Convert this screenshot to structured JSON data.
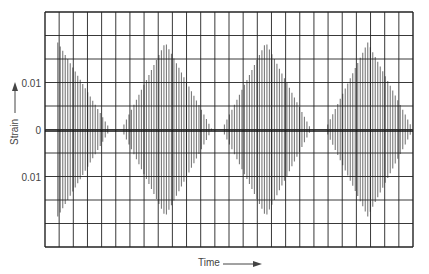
{
  "chart_data": {
    "type": "line",
    "title": "",
    "xlabel": "Time",
    "ylabel": "Strain",
    "y_tick_labels": [
      {
        "label": "0.01",
        "value": 0.01
      },
      {
        "label": "0",
        "value": 0
      },
      {
        "label": "0.01",
        "value": -0.01
      }
    ],
    "ylim": [
      -0.027,
      0.027
    ],
    "grid": true,
    "grid_divisions": {
      "x": 26,
      "y": 10
    },
    "series": [
      {
        "name": "strain envelope",
        "bursts": [
          {
            "start_x_div": 0.9,
            "peak_x_div": 0.9,
            "end_x_div": 4.6,
            "peak_amplitude": 0.02
          },
          {
            "start_x_div": 5.4,
            "peak_x_div": 8.5,
            "end_x_div": 11.8,
            "peak_amplitude": 0.02
          },
          {
            "start_x_div": 12.5,
            "peak_x_div": 15.6,
            "end_x_div": 18.8,
            "peak_amplitude": 0.02
          },
          {
            "start_x_div": 19.8,
            "peak_x_div": 22.8,
            "end_x_div": 26.0,
            "peak_amplitude": 0.02
          }
        ]
      }
    ],
    "colors": {
      "grid": "#222222",
      "signal": "#7a7a7a",
      "background": "#ffffff"
    }
  }
}
